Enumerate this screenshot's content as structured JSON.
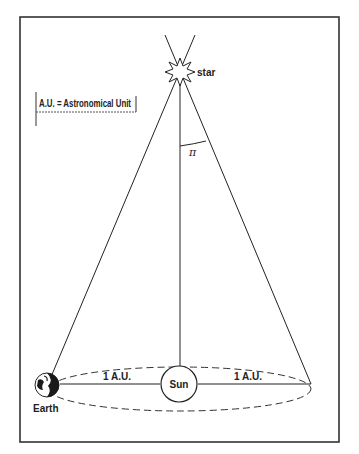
{
  "diagram": {
    "legend": {
      "text": "A.U. = Astronomical Unit"
    },
    "labels": {
      "star": "star",
      "sun": "Sun",
      "earth": "Earth",
      "angle": "π",
      "left_distance": "1 A.U.",
      "right_distance": "1 A.U."
    },
    "colors": {
      "stroke": "#222222",
      "background": "#ffffff",
      "earth_fill": "#1a1a1a"
    }
  }
}
